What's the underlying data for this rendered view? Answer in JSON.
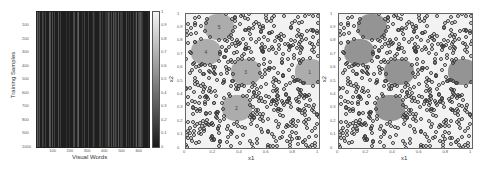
{
  "chart_data": [
    {
      "type": "heatmap",
      "title": "",
      "xlabel": "Visual Words",
      "ylabel": "Training Samples",
      "x_ticks": [
        "100",
        "200",
        "300",
        "400",
        "500",
        "600"
      ],
      "y_ticks": [
        "100",
        "200",
        "300",
        "400",
        "500",
        "600",
        "700",
        "800",
        "900",
        "1000"
      ],
      "xlim": [
        0,
        650
      ],
      "ylim": [
        0,
        1000
      ],
      "colorbar": {
        "min": 0,
        "max": 1,
        "ticks": [
          "0.1",
          "0.2",
          "0.3",
          "0.4",
          "0.5",
          "0.6",
          "0.7",
          "0.8",
          "0.9",
          "1"
        ]
      },
      "description": "Sparse matrix: mostly near-zero (dark) values with thin bright vertical stripes"
    },
    {
      "type": "scatter",
      "title": "",
      "xlabel": "x1",
      "ylabel": "x2",
      "x_ticks": [
        "0",
        "0.2",
        "0.4",
        "0.6",
        "0.8",
        "1"
      ],
      "y_ticks": [
        "0",
        "0.1",
        "0.2",
        "0.3",
        "0.4",
        "0.5",
        "0.6",
        "0.7",
        "0.8",
        "0.9",
        "1"
      ],
      "xlim": [
        0,
        1
      ],
      "ylim": [
        0,
        1
      ],
      "series": [
        {
          "name": "background points",
          "marker": "o",
          "color": "#3d3d3d"
        },
        {
          "name": "cluster blobs",
          "marker": "filled",
          "color": "#a8a8a8"
        }
      ],
      "clusters": [
        {
          "label": "5",
          "x": 0.25,
          "y": 0.9
        },
        {
          "label": "4",
          "x": 0.15,
          "y": 0.72
        },
        {
          "label": "3",
          "x": 0.45,
          "y": 0.57
        },
        {
          "label": "1",
          "x": 0.93,
          "y": 0.57
        },
        {
          "label": "2",
          "x": 0.38,
          "y": 0.3
        }
      ]
    },
    {
      "type": "scatter",
      "title": "",
      "xlabel": "x1",
      "ylabel": "x2",
      "x_ticks": [
        "0",
        "0.2",
        "0.4",
        "0.6",
        "0.8",
        "1"
      ],
      "y_ticks": [
        "0",
        "0.1",
        "0.2",
        "0.3",
        "0.4",
        "0.5",
        "0.6",
        "0.7",
        "0.8",
        "0.9",
        "1"
      ],
      "xlim": [
        0,
        1
      ],
      "ylim": [
        0,
        1
      ],
      "series": [
        {
          "name": "background points",
          "marker": "o",
          "color": "#3d3d3d"
        },
        {
          "name": "cluster blobs",
          "marker": "filled",
          "color": "#8c8c8c"
        }
      ],
      "clusters": [
        {
          "label": "",
          "x": 0.25,
          "y": 0.9
        },
        {
          "label": "",
          "x": 0.15,
          "y": 0.72
        },
        {
          "label": "",
          "x": 0.45,
          "y": 0.57
        },
        {
          "label": "",
          "x": 0.93,
          "y": 0.57
        },
        {
          "label": "",
          "x": 0.38,
          "y": 0.3
        }
      ]
    }
  ]
}
